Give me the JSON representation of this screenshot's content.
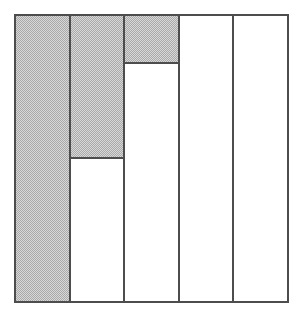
{
  "figure": {
    "title": "",
    "background_color": "#ffffff",
    "outline_color": "#4d4d4d",
    "shade_color": "#a9a9a9"
  },
  "chart_data": {
    "type": "bar",
    "title": "",
    "subtitle": "",
    "xlabel": "",
    "ylabel": "",
    "orientation": "vertical",
    "fill_origin": "top",
    "grid": false,
    "legend": null,
    "axis_visible": false,
    "tick_labels_visible": false,
    "ylim": [
      0,
      100
    ],
    "categories": [
      "1",
      "2",
      "3",
      "4",
      "5"
    ],
    "value_unit": "percent shaded",
    "values": [
      100,
      50,
      17,
      0,
      0
    ],
    "series": [
      {
        "name": "Shaded portion",
        "color": "#a9a9a9",
        "values": [
          100,
          50,
          17,
          0,
          0
        ]
      },
      {
        "name": "Unshaded portion",
        "color": "#ffffff",
        "values": [
          0,
          50,
          83,
          100,
          100
        ]
      }
    ],
    "annotations": []
  },
  "columns": [
    {
      "name": "column-1",
      "shaded_percent": 100,
      "shaded_label": "100",
      "fill_style": "solid-grey",
      "has_divider_line": false
    },
    {
      "name": "column-2",
      "shaded_percent": 50,
      "shaded_label": "50",
      "fill_style": "solid-grey",
      "has_divider_line": true
    },
    {
      "name": "column-3",
      "shaded_percent": 17,
      "shaded_label": "17",
      "fill_style": "solid-grey",
      "has_divider_line": true
    },
    {
      "name": "column-4",
      "shaded_percent": 0,
      "shaded_label": "0",
      "fill_style": "none",
      "has_divider_line": false
    },
    {
      "name": "column-5",
      "shaded_percent": 0,
      "shaded_label": "0",
      "fill_style": "none",
      "has_divider_line": false
    }
  ]
}
